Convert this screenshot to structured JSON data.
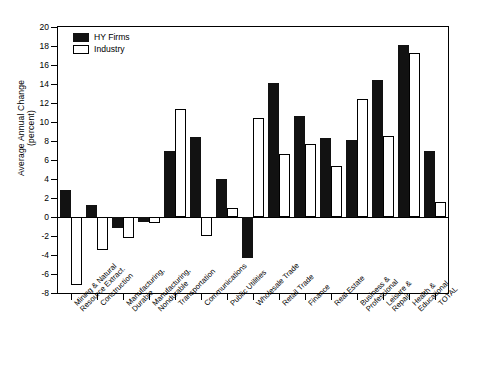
{
  "chart_data": {
    "type": "bar",
    "title": "",
    "xlabel": "",
    "ylabel": "Average Annual Change\n(percent)",
    "ylim": [
      -8,
      20
    ],
    "ytick_step": 2,
    "yticks": [
      20,
      18,
      16,
      14,
      12,
      10,
      8,
      6,
      4,
      2,
      0,
      -2,
      -4,
      -6,
      -8
    ],
    "ytick_labels": [
      "20",
      "18",
      "16",
      "14",
      "12",
      "10",
      "8",
      "6",
      "4",
      "2",
      "0",
      "-2",
      "-4",
      "-6",
      "-8"
    ],
    "grid": false,
    "legend_position": "upper left",
    "categories": [
      "Mining & Natural\nResource Extract.",
      "Construction",
      "Manufacturing,\nDurable",
      "Manufacturing,\nNondurable",
      "Transportation",
      "Communications",
      "Public Utilities",
      "Wholesale Trade",
      "Retail Trade",
      "Finance",
      "Real Estate",
      "Business &\nProfessional",
      "Leisure &\nRepair",
      "Health &\nEducational",
      "TOTAL"
    ],
    "series": [
      {
        "name": "HY Firms",
        "color": "#121212",
        "values": [
          2.8,
          1.3,
          -1.2,
          -0.5,
          7.0,
          8.4,
          4.0,
          -4.3,
          14.1,
          10.6,
          8.3,
          8.1,
          14.4,
          18.1,
          6.9
        ]
      },
      {
        "name": "Industry",
        "color": "#ffffff",
        "values": [
          -7.2,
          -3.5,
          -2.2,
          -0.6,
          11.4,
          -2.0,
          0.9,
          10.4,
          6.6,
          7.7,
          5.4,
          12.4,
          8.5,
          17.3,
          1.6
        ]
      }
    ]
  },
  "legend": {
    "items": [
      {
        "label": "HY Firms"
      },
      {
        "label": "Industry"
      }
    ]
  }
}
